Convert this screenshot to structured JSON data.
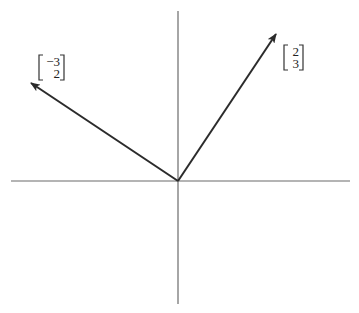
{
  "diagram": {
    "type": "vector-plot",
    "colors": {
      "axis": "#6b6b6b",
      "vector": "#2b2b2b",
      "text": "#222222",
      "background": "#ffffff"
    },
    "axes": {
      "origin_px": [
        178,
        181
      ],
      "horizontal": {
        "x1": 11,
        "x2": 350
      },
      "vertical": {
        "y1": 11,
        "y2": 304
      }
    },
    "scale_px_per_unit": 49,
    "vectors": [
      {
        "id": "v1",
        "components": [
          2,
          3
        ],
        "label_top": "2",
        "label_bottom": "3",
        "label_pos_px": [
          284,
          45
        ]
      },
      {
        "id": "v2",
        "components": [
          -3,
          2
        ],
        "label_top": "−3",
        "label_bottom": "2",
        "label_pos_px": [
          39,
          55
        ]
      }
    ]
  }
}
